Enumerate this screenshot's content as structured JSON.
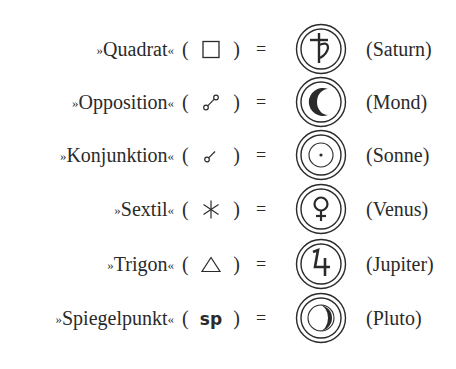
{
  "rows": [
    {
      "term": "Quadrat",
      "aspect_symbol": "square",
      "equals": "=",
      "planet_symbol": "saturn-glyph",
      "planet": "(Saturn)"
    },
    {
      "term": "Opposition",
      "aspect_symbol": "opposition",
      "equals": "=",
      "planet_symbol": "moon-crescent",
      "planet": "(Mond)"
    },
    {
      "term": "Konjunktion",
      "aspect_symbol": "conjunction",
      "equals": "=",
      "planet_symbol": "sun-circle-dot",
      "planet": "(Sonne)"
    },
    {
      "term": "Sextil",
      "aspect_symbol": "sextile",
      "equals": "=",
      "planet_symbol": "venus-glyph",
      "planet": "(Venus)"
    },
    {
      "term": "Trigon",
      "aspect_symbol": "triangle",
      "equals": "=",
      "planet_symbol": "jupiter-glyph",
      "planet": "(Jupiter)"
    },
    {
      "term": "Spiegelpunkt",
      "aspect_symbol": "sp",
      "equals": "=",
      "planet_symbol": "pluto-crescent",
      "planet": "(Pluto)"
    }
  ],
  "quote_open": "»",
  "quote_close": "«",
  "paren_open": "(",
  "paren_close": ")",
  "sp_text": "sp",
  "colors": {
    "ink": "#2a2a2a",
    "background": "#ffffff"
  }
}
